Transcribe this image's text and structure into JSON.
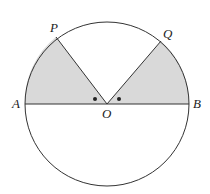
{
  "diagram": {
    "type": "circle-geometry",
    "labels": {
      "P": "P",
      "Q": "Q",
      "A": "A",
      "B": "B",
      "O": "O"
    },
    "colors": {
      "shade": "#d9d9d9",
      "stroke": "#333333",
      "background": "#ffffff"
    }
  }
}
